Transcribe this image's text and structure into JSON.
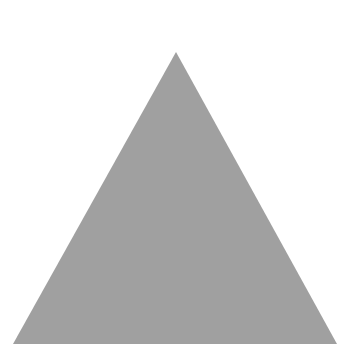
{
  "shape": {
    "type": "triangle",
    "fill": "#a0a0a0",
    "background": "#ffffff"
  }
}
